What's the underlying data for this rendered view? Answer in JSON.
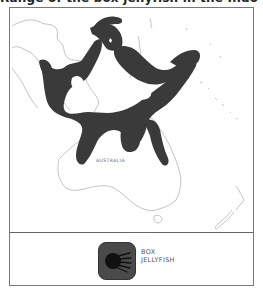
{
  "title": "Range of the box jellyfish in the Indo-Pacific",
  "map": {
    "region": "Southeast Asia and Australia",
    "labels": [
      "AUSTRALIA"
    ],
    "range_fill_color": "#3a3a3a",
    "coastline_color": "#9a9a9a",
    "background_color": "#ffffff"
  },
  "legend": {
    "items": [
      {
        "icon": "jellyfish-icon",
        "label_line1": "BOX",
        "label_line2": "JELLYFISH",
        "swatch_color": "#4a4a4a"
      }
    ]
  }
}
